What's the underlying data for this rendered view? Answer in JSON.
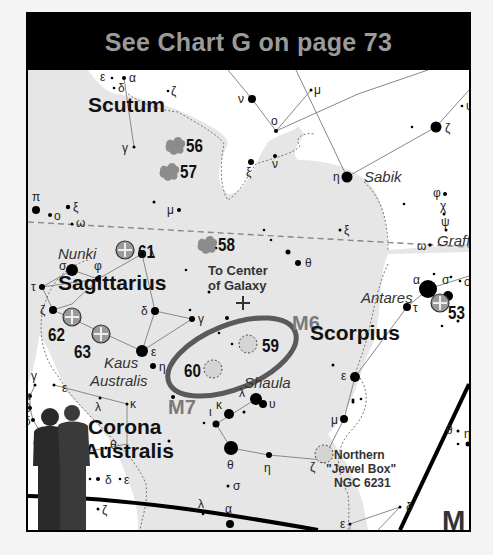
{
  "header": {
    "prefix": "See ",
    "chart_name": "Chart G",
    "suffix": " on page 73"
  },
  "colors": {
    "milky_way": "#e6e6e6",
    "sky": "#ffffff",
    "star": "#000000",
    "cluster_fill": "#8c8c8c",
    "globular_fill": "#9a9a9a",
    "open_cluster_fill": "#d4d4d4",
    "ellipse": "#5a5a5a",
    "m_label": "#7a7a7a",
    "header_bg": "#000000",
    "header_text": "#9a9a9a"
  },
  "constellations": [
    {
      "name": "Scutum",
      "x": 60,
      "y": 98,
      "size": 21
    },
    {
      "name": "Sagittarius",
      "x": 30,
      "y": 276,
      "size": 21
    },
    {
      "name": "Scorpius",
      "x": 282,
      "y": 326,
      "size": 21
    },
    {
      "name": "Corona",
      "x": 60,
      "y": 420,
      "size": 21
    },
    {
      "name": "Australis",
      "x": 56,
      "y": 444,
      "size": 21
    }
  ],
  "star_names": [
    {
      "name": "Sabik",
      "x": 336,
      "y": 168
    },
    {
      "name": "Nunki",
      "x": 30,
      "y": 245
    },
    {
      "name": "Kaus",
      "x": 76,
      "y": 354
    },
    {
      "name": "Australis",
      "x": 62,
      "y": 372
    },
    {
      "name": "Antares",
      "x": 333,
      "y": 289
    },
    {
      "name": "Shaula",
      "x": 216,
      "y": 374
    },
    {
      "name": "Graff",
      "x": 409,
      "y": 232
    }
  ],
  "objects": [
    {
      "id": "56",
      "type": "star-cloud",
      "x": 148,
      "y": 131,
      "label_x": 158,
      "label_y": 138
    },
    {
      "id": "57",
      "type": "star-cloud",
      "x": 142,
      "y": 157,
      "label_x": 152,
      "label_y": 164
    },
    {
      "id": "58",
      "type": "star-cloud",
      "x": 180,
      "y": 230,
      "label_x": 190,
      "label_y": 237
    },
    {
      "id": "61",
      "type": "globular",
      "x": 97,
      "y": 236,
      "label_x": 110,
      "label_y": 244
    },
    {
      "id": "62",
      "type": "globular",
      "x": 44,
      "y": 303,
      "label_x": 20,
      "label_y": 327
    },
    {
      "id": "63",
      "type": "globular",
      "x": 73,
      "y": 320,
      "label_x": 46,
      "label_y": 344
    },
    {
      "id": "53",
      "type": "globular",
      "x": 412,
      "y": 289,
      "label_x": 420,
      "label_y": 305
    },
    {
      "id": "59",
      "type": "open-cluster",
      "x": 220,
      "y": 330,
      "label_x": 234,
      "label_y": 338
    },
    {
      "id": "60",
      "type": "open-cluster",
      "x": 185,
      "y": 355,
      "label_x": 156,
      "label_y": 363
    },
    {
      "id": "Northern \"Jewel Box\"",
      "type": "open-cluster",
      "x": 296,
      "y": 440
    }
  ],
  "messier": [
    {
      "name": "M6",
      "x": 264,
      "y": 316
    },
    {
      "name": "M7",
      "x": 140,
      "y": 400
    }
  ],
  "annotations": {
    "galactic_center_line1": "To Center",
    "galactic_center_line2": "of Galaxy",
    "jewel_box_line1": "Northern",
    "jewel_box_line2": "\"Jewel Box\"",
    "jewel_box_line3": "NGC 6231",
    "corner_letter": "M"
  },
  "stars": [
    {
      "x": 96,
      "y": 64,
      "r": 2,
      "label": "α",
      "lx": 101,
      "ly": 68
    },
    {
      "x": 84,
      "y": 64,
      "r": 1.3,
      "label": "ε",
      "lx": 72,
      "ly": 67
    },
    {
      "x": 86,
      "y": 74,
      "r": 1.3,
      "label": "δ",
      "lx": 90,
      "ly": 78
    },
    {
      "x": 140,
      "y": 77,
      "r": 1.3,
      "label": "ζ",
      "lx": 143,
      "ly": 81
    },
    {
      "x": 106,
      "y": 133,
      "r": 1.5,
      "label": "γ",
      "lx": 94,
      "ly": 138
    },
    {
      "x": 224,
      "y": 85,
      "r": 4,
      "label": "ν",
      "lx": 210,
      "ly": 89
    },
    {
      "x": 283,
      "y": 76,
      "r": 1.5,
      "label": "μ",
      "lx": 286,
      "ly": 80
    },
    {
      "x": 248,
      "y": 117,
      "r": 2,
      "label": "ο",
      "lx": 243,
      "ly": 111
    },
    {
      "x": 247,
      "y": 142,
      "r": 2,
      "label": "ν",
      "lx": 244,
      "ly": 154
    },
    {
      "x": 223,
      "y": 148,
      "r": 3,
      "label": "ξ",
      "lx": 218,
      "ly": 162
    },
    {
      "x": 319,
      "y": 163,
      "r": 5.5,
      "label": "η",
      "lx": 305,
      "ly": 167
    },
    {
      "x": 408,
      "y": 113,
      "r": 5.5,
      "label": "ζ",
      "lx": 417,
      "ly": 118
    },
    {
      "x": 384,
      "y": 113,
      "r": 1.3
    },
    {
      "x": 434,
      "y": 92,
      "r": 1.3,
      "label": "υ",
      "lx": 438,
      "ly": 96
    },
    {
      "x": 417,
      "y": 180,
      "r": 2,
      "label": "φ",
      "lx": 405,
      "ly": 183
    },
    {
      "x": 416,
      "y": 200,
      "r": 1.5,
      "label": "χ",
      "lx": 412,
      "ly": 196
    },
    {
      "x": 418,
      "y": 216,
      "r": 1.5,
      "label": "ψ",
      "lx": 413,
      "ly": 212
    },
    {
      "x": 376,
      "y": 190,
      "r": 1.3
    },
    {
      "x": 312,
      "y": 216,
      "r": 1.5,
      "label": "ξ",
      "lx": 316,
      "ly": 220
    },
    {
      "x": 402,
      "y": 231,
      "r": 1.7,
      "label": "ω",
      "lx": 389,
      "ly": 236
    },
    {
      "x": 236,
      "y": 216,
      "r": 1.3
    },
    {
      "x": 8,
      "y": 196,
      "r": 4,
      "label": "π",
      "lx": 4,
      "ly": 187
    },
    {
      "x": 22,
      "y": 201,
      "r": 2,
      "label": "ο",
      "lx": 26,
      "ly": 206
    },
    {
      "x": 40,
      "y": 193,
      "r": 2.2,
      "label": "ξ",
      "lx": 45,
      "ly": 197
    },
    {
      "x": 44,
      "y": 210,
      "r": 1.5,
      "label": "ω",
      "lx": 48,
      "ly": 213
    },
    {
      "x": 126,
      "y": 188,
      "r": 1.5
    },
    {
      "x": 151,
      "y": 196,
      "r": 2,
      "label": "μ",
      "lx": 139,
      "ly": 200
    },
    {
      "x": 44,
      "y": 256,
      "r": 6,
      "label": "σ",
      "lx": 31,
      "ly": 256
    },
    {
      "x": 70,
      "y": 265,
      "r": 3,
      "label": "φ",
      "lx": 66,
      "ly": 256
    },
    {
      "x": 114,
      "y": 240,
      "r": 4,
      "label": "λ",
      "lx": 121,
      "ly": 244
    },
    {
      "x": 14,
      "y": 273,
      "r": 3,
      "label": "τ",
      "lx": 3,
      "ly": 277
    },
    {
      "x": 25,
      "y": 296,
      "r": 4,
      "label": "ζ",
      "lx": 12,
      "ly": 300
    },
    {
      "x": 127,
      "y": 297,
      "r": 4,
      "label": "δ",
      "lx": 113,
      "ly": 301
    },
    {
      "x": 164,
      "y": 305,
      "r": 3,
      "label": "γ",
      "lx": 170,
      "ly": 309
    },
    {
      "x": 114,
      "y": 337,
      "r": 6,
      "label": "ε",
      "lx": 123,
      "ly": 342
    },
    {
      "x": 162,
      "y": 296,
      "r": 1.3
    },
    {
      "x": 158,
      "y": 256,
      "r": 1.3
    },
    {
      "x": 188,
      "y": 234,
      "r": 1.3
    },
    {
      "x": 243,
      "y": 226,
      "r": 1.3
    },
    {
      "x": 260,
      "y": 238,
      "r": 2.5
    },
    {
      "x": 270,
      "y": 249,
      "r": 3,
      "label": "θ",
      "lx": 277,
      "ly": 253
    },
    {
      "x": 181,
      "y": 278,
      "r": 1.5
    },
    {
      "x": 125,
      "y": 352,
      "r": 3,
      "label": "η",
      "lx": 131,
      "ly": 357
    },
    {
      "x": 204,
      "y": 330,
      "r": 1.3
    },
    {
      "x": 199,
      "y": 304,
      "r": 2
    },
    {
      "x": 191,
      "y": 319,
      "r": 1.3
    },
    {
      "x": 400,
      "y": 275,
      "r": 9,
      "label": "α",
      "lx": 385,
      "ly": 270
    },
    {
      "x": 420,
      "y": 282,
      "r": 5,
      "label": "σ",
      "lx": 414,
      "ly": 270
    },
    {
      "x": 432,
      "y": 267,
      "r": 1.3,
      "label": "ο",
      "lx": 436,
      "ly": 272
    },
    {
      "x": 423,
      "y": 263,
      "r": 1.3
    },
    {
      "x": 406,
      "y": 260,
      "r": 1.3
    },
    {
      "x": 379,
      "y": 293,
      "r": 4,
      "label": "τ",
      "lx": 385,
      "ly": 298
    },
    {
      "x": 430,
      "y": 307,
      "r": 1.5
    },
    {
      "x": 414,
      "y": 312,
      "r": 1.3
    },
    {
      "x": 327,
      "y": 363,
      "r": 5,
      "label": "ε",
      "lx": 313,
      "ly": 366
    },
    {
      "x": 325,
      "y": 386,
      "r": 1.5
    },
    {
      "x": 333,
      "y": 385,
      "r": 1.3
    },
    {
      "x": 305,
      "y": 351,
      "r": 1.5
    },
    {
      "x": 325,
      "y": 388,
      "r": 1.5
    },
    {
      "x": 316,
      "y": 405,
      "r": 4,
      "label": "μ",
      "lx": 303,
      "ly": 410
    },
    {
      "x": 430,
      "y": 417,
      "r": 1.5,
      "label": "θ",
      "lx": 418,
      "ly": 420
    },
    {
      "x": 440,
      "y": 430,
      "r": 2.5,
      "label": "η",
      "lx": 436,
      "ly": 424
    },
    {
      "x": 430,
      "y": 430,
      "r": 1.3
    },
    {
      "x": 241,
      "y": 441,
      "r": 3,
      "label": "η",
      "lx": 236,
      "ly": 458
    },
    {
      "x": 295,
      "y": 446,
      "r": 3,
      "label": "ζ",
      "lx": 282,
      "ly": 457
    },
    {
      "x": 203,
      "y": 434,
      "r": 7,
      "label": "θ",
      "lx": 199,
      "ly": 455
    },
    {
      "x": 228,
      "y": 385,
      "r": 6,
      "label": "λ",
      "lx": 211,
      "ly": 383
    },
    {
      "x": 235,
      "y": 390,
      "r": 4,
      "label": "υ",
      "lx": 241,
      "ly": 394
    },
    {
      "x": 201,
      "y": 400,
      "r": 5,
      "label": "κ",
      "lx": 188,
      "ly": 395
    },
    {
      "x": 188,
      "y": 410,
      "r": 3.5,
      "label": "ι",
      "lx": 181,
      "ly": 402
    },
    {
      "x": 176,
      "y": 409,
      "r": 1.3
    },
    {
      "x": 216,
      "y": 398,
      "r": 1.5
    },
    {
      "x": 145,
      "y": 383,
      "r": 2
    },
    {
      "x": 200,
      "y": 472,
      "r": 1.5,
      "label": "σ",
      "lx": 205,
      "ly": 476
    },
    {
      "x": 175,
      "y": 500,
      "r": 1.3,
      "label": "λ",
      "lx": 170,
      "ly": 494
    },
    {
      "x": 202,
      "y": 510,
      "r": 4,
      "label": "α",
      "lx": 197,
      "ly": 499
    },
    {
      "x": 141,
      "y": 427,
      "r": 1.5
    },
    {
      "x": 143,
      "y": 392,
      "r": 1.3
    },
    {
      "x": 372,
      "y": 493,
      "r": 1.5,
      "label": "δ",
      "lx": 378,
      "ly": 497
    },
    {
      "x": 322,
      "y": 510,
      "r": 1.5,
      "label": "ε",
      "lx": 312,
      "ly": 514
    },
    {
      "x": 26,
      "y": 371,
      "r": 1.5,
      "label": "ε",
      "lx": 34,
      "ly": 378
    },
    {
      "x": 7,
      "y": 371,
      "r": 1.5,
      "label": "γ",
      "lx": 3,
      "ly": 366
    },
    {
      "x": 72,
      "y": 384,
      "r": 1.5,
      "label": "λ",
      "lx": 67,
      "ly": 397
    },
    {
      "x": 99,
      "y": 390,
      "r": 1.5,
      "label": "κ",
      "lx": 102,
      "ly": 394
    },
    {
      "x": 2,
      "y": 382,
      "r": 2,
      "label": "α",
      "lx": -4,
      "ly": 386
    },
    {
      "x": 2,
      "y": 394,
      "r": 2,
      "label": "β",
      "lx": -4,
      "ly": 398
    },
    {
      "x": 5,
      "y": 406,
      "r": 2,
      "label": "δ",
      "lx": -4,
      "ly": 411
    },
    {
      "x": 15,
      "y": 422,
      "r": 1.5,
      "label": "ζ",
      "lx": 5,
      "ly": 431
    },
    {
      "x": 42,
      "y": 441,
      "r": 1.5,
      "label": "η",
      "lx": 33,
      "ly": 437
    },
    {
      "x": 78,
      "y": 434,
      "r": 1.5,
      "label": "θ",
      "lx": 82,
      "ly": 435
    },
    {
      "x": 70,
      "y": 465,
      "r": 2,
      "label": "δ",
      "lx": 77,
      "ly": 470
    },
    {
      "x": 62,
      "y": 465,
      "r": 1.3
    },
    {
      "x": 92,
      "y": 465,
      "r": 1.3,
      "label": "ε",
      "lx": 96,
      "ly": 470
    },
    {
      "x": 70,
      "y": 495,
      "r": 1.5,
      "label": "ζ",
      "lx": 74,
      "ly": 500
    }
  ],
  "chart_data": {
    "type": "star-map",
    "title": "See Chart G on page 73",
    "constellations": [
      "Scutum",
      "Sagittarius",
      "Scorpius",
      "Corona Australis"
    ],
    "named_stars": [
      "Sabik",
      "Nunki",
      "Kaus Australis",
      "Antares",
      "Shaula",
      "Graff"
    ],
    "deep_sky_objects": [
      "56",
      "57",
      "58",
      "59",
      "60",
      "61",
      "62",
      "63",
      "53",
      "M6",
      "M7",
      "NGC 6231"
    ]
  }
}
